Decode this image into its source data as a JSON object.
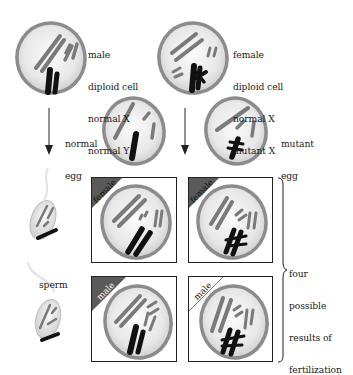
{
  "parents": {
    "male": {
      "lines": [
        "male",
        "diploid cell",
        "normal X",
        "normal Y"
      ]
    },
    "female": {
      "lines": [
        "female",
        "diploid cell",
        "normal X",
        "mutant X"
      ]
    }
  },
  "eggs": {
    "normal": {
      "lines": [
        "normal",
        "egg"
      ]
    },
    "mutant": {
      "lines": [
        "mutant",
        "egg"
      ]
    }
  },
  "sperm": {
    "label": "sperm"
  },
  "results": {
    "boxes": [
      {
        "tag": "female",
        "egg": "normal",
        "sperm": "X"
      },
      {
        "tag": "female",
        "egg": "mutant",
        "sperm": "X"
      },
      {
        "tag": "male",
        "egg": "normal",
        "sperm": "Y"
      },
      {
        "tag": "male",
        "egg": "mutant",
        "sperm": "Y"
      }
    ],
    "bracket_label": [
      "four",
      "possible",
      "results of",
      "fertilization"
    ]
  },
  "colors": {
    "cell_rim": "#8c8c8c",
    "cell_fill": "#e9e9e9",
    "chromosome_gray": "#7a7a7a",
    "chromosome_black": "#111111",
    "tag_fill": "#5a5a5a"
  }
}
